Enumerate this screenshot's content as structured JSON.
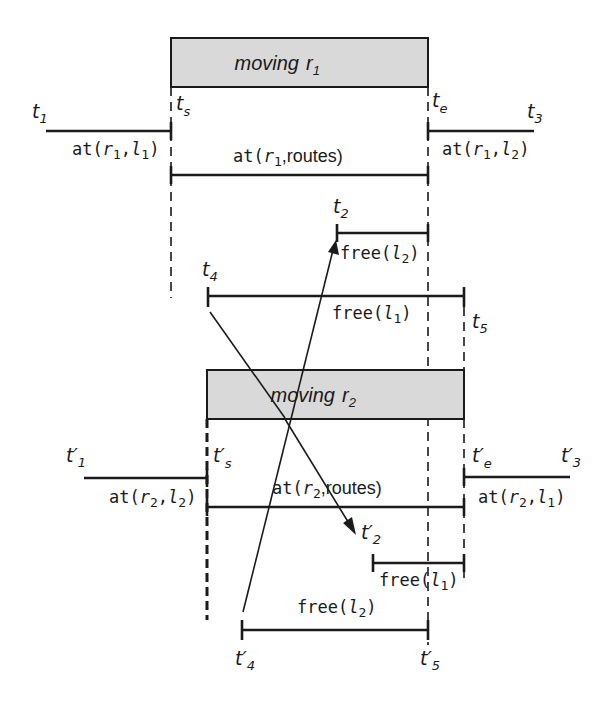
{
  "diagram": {
    "robot1": {
      "box_label": "moving",
      "box_var": "r",
      "box_sub": "1",
      "time_points": {
        "t1": {
          "base": "t",
          "sub": "1"
        },
        "ts": {
          "base": "t",
          "sub": "s"
        },
        "te": {
          "base": "t",
          "sub": "e"
        },
        "t3": {
          "base": "t",
          "sub": "3"
        },
        "t2": {
          "base": "t",
          "sub": "2"
        },
        "t4": {
          "base": "t",
          "sub": "4"
        },
        "t5": {
          "base": "t",
          "sub": "5"
        }
      },
      "intervals": {
        "at_r1_l1": {
          "pred": "at(",
          "a": "r",
          "a_sub": "1",
          "sep": ",",
          "b": "l",
          "b_sub": "1",
          "close": ")"
        },
        "at_r1_routes": {
          "pred": "at(",
          "a": "r",
          "a_sub": "1",
          "rest": ",routes)"
        },
        "at_r1_l2": {
          "pred": "at(",
          "a": "r",
          "a_sub": "1",
          "sep": ",",
          "b": "l",
          "b_sub": "2",
          "close": ")"
        },
        "free_l2": {
          "pred": "free(",
          "b": "l",
          "b_sub": "2",
          "close": ")"
        },
        "free_l1": {
          "pred": "free(",
          "b": "l",
          "b_sub": "1",
          "close": ")"
        }
      }
    },
    "robot2": {
      "box_label": "moving",
      "box_var": "r",
      "box_sub": "2",
      "time_points": {
        "t1p": {
          "base": "t′",
          "sub": "1"
        },
        "tsp": {
          "base": "t′",
          "sub": "s"
        },
        "tep": {
          "base": "t′",
          "sub": "e"
        },
        "t3p": {
          "base": "t′",
          "sub": "3"
        },
        "t2p": {
          "base": "t′",
          "sub": "2"
        },
        "t4p": {
          "base": "t′",
          "sub": "4"
        },
        "t5p": {
          "base": "t′",
          "sub": "5"
        }
      },
      "intervals": {
        "at_r2_l2": {
          "pred": "at(",
          "a": "r",
          "a_sub": "2",
          "sep": ",",
          "b": "l",
          "b_sub": "2",
          "close": ")"
        },
        "at_r2_routes": {
          "pred": "at(",
          "a": "r",
          "a_sub": "2",
          "rest": ",routes)"
        },
        "at_r2_l1": {
          "pred": "at(",
          "a": "r",
          "a_sub": "2",
          "sep": ",",
          "b": "l",
          "b_sub": "1",
          "close": ")"
        },
        "free_l1": {
          "pred": "free(",
          "b": "l",
          "b_sub": "1",
          "close": ")"
        },
        "free_l2": {
          "pred": "free(",
          "b": "l",
          "b_sub": "2",
          "close": ")"
        }
      }
    }
  }
}
